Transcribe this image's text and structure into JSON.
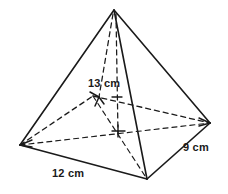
{
  "figure": {
    "name": "square-pyramid-diagram",
    "shape": "square pyramid",
    "stroke_color": "#1a1a1a",
    "background_color": "#ffffff",
    "labels": {
      "height": "13 cm",
      "base_length": "12 cm",
      "base_width": "9 cm"
    },
    "measurements": [
      {
        "id": "height",
        "value": 13,
        "unit": "cm",
        "text": "13 cm",
        "refers_to": "slant height from apex to base edge"
      },
      {
        "id": "base_length",
        "value": 12,
        "unit": "cm",
        "text": "12 cm",
        "refers_to": "front-left base edge"
      },
      {
        "id": "base_width",
        "value": 9,
        "unit": "cm",
        "text": "9 cm",
        "refers_to": "front-right base edge"
      }
    ],
    "vertices": {
      "apex": [
        114,
        10
      ],
      "left": [
        20,
        145
      ],
      "front": [
        147,
        179
      ],
      "right": [
        210,
        123
      ],
      "back": [
        93,
        96
      ],
      "base_center": [
        118,
        131
      ]
    },
    "solid_edges": [
      [
        "apex",
        "left"
      ],
      [
        "apex",
        "front"
      ],
      [
        "apex",
        "right"
      ],
      [
        "left",
        "front"
      ],
      [
        "front",
        "right"
      ]
    ],
    "dashed_edges": [
      [
        "left",
        "back"
      ],
      [
        "back",
        "right"
      ],
      [
        "apex",
        "back"
      ],
      [
        "left",
        "right"
      ],
      [
        "back",
        "front"
      ],
      [
        "apex",
        "base_center"
      ]
    ]
  }
}
